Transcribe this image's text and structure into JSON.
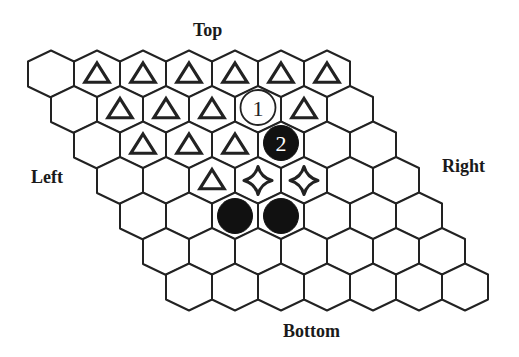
{
  "labels": {
    "top": "Top",
    "left": "Left",
    "right": "Right",
    "bottom": "Bottom"
  },
  "board": {
    "rows": 7,
    "cols": 7,
    "layout": "rhombus, each row shifted half a cell to the right",
    "geometry": {
      "origin_x": 51,
      "origin_y": 74,
      "cell_width": 46,
      "row_shift_x": 23,
      "row_spacing_y": 35.5,
      "side_half": 12.5,
      "point_height": 11
    },
    "colors": {
      "line": "#222222",
      "cell_fill": "#ffffff",
      "black_stone": "#111111",
      "white_stone_fill": "#ffffff",
      "stone_number_on_black": "#ffffff",
      "stone_number_on_white": "#222222"
    },
    "pieces": [
      {
        "row": 0,
        "col": 1,
        "type": "triangle"
      },
      {
        "row": 0,
        "col": 2,
        "type": "triangle"
      },
      {
        "row": 0,
        "col": 3,
        "type": "triangle"
      },
      {
        "row": 0,
        "col": 4,
        "type": "triangle"
      },
      {
        "row": 0,
        "col": 5,
        "type": "triangle"
      },
      {
        "row": 0,
        "col": 6,
        "type": "triangle"
      },
      {
        "row": 1,
        "col": 1,
        "type": "triangle"
      },
      {
        "row": 1,
        "col": 2,
        "type": "triangle"
      },
      {
        "row": 1,
        "col": 3,
        "type": "triangle"
      },
      {
        "row": 1,
        "col": 4,
        "type": "white-stone",
        "label": "1"
      },
      {
        "row": 1,
        "col": 5,
        "type": "triangle"
      },
      {
        "row": 2,
        "col": 1,
        "type": "triangle"
      },
      {
        "row": 2,
        "col": 2,
        "type": "triangle"
      },
      {
        "row": 2,
        "col": 3,
        "type": "triangle"
      },
      {
        "row": 2,
        "col": 4,
        "type": "black-stone",
        "label": "2"
      },
      {
        "row": 3,
        "col": 2,
        "type": "triangle"
      },
      {
        "row": 3,
        "col": 3,
        "type": "star"
      },
      {
        "row": 3,
        "col": 4,
        "type": "star"
      },
      {
        "row": 4,
        "col": 2,
        "type": "black-stone"
      },
      {
        "row": 4,
        "col": 3,
        "type": "black-stone"
      }
    ]
  }
}
